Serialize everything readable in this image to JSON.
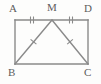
{
  "figure": {
    "kind": "geometry-diagram",
    "background_color": "#fdfdfc",
    "stroke_color": "#8a8a8a",
    "label_color": "#5d5d5d",
    "stroke_width": 1.4,
    "tick_stroke_width": 1.1,
    "labels": {
      "A": "A",
      "M": "M",
      "D": "D",
      "B": "B",
      "C": "C"
    },
    "points": {
      "A": {
        "x": 15,
        "y": 20
      },
      "M": {
        "x": 52,
        "y": 20
      },
      "D": {
        "x": 88,
        "y": 20
      },
      "B": {
        "x": 15,
        "y": 64
      },
      "C": {
        "x": 88,
        "y": 64
      }
    },
    "segments": [
      {
        "name": "AD",
        "from": "A",
        "to": "D",
        "ticks": 0
      },
      {
        "name": "AB",
        "from": "A",
        "to": "B",
        "ticks": 0
      },
      {
        "name": "DC",
        "from": "D",
        "to": "C",
        "ticks": 0
      },
      {
        "name": "BC",
        "from": "B",
        "to": "C",
        "ticks": 0
      },
      {
        "name": "AM",
        "from": "A",
        "to": "M",
        "ticks": 2
      },
      {
        "name": "MD",
        "from": "M",
        "to": "D",
        "ticks": 2
      },
      {
        "name": "MB",
        "from": "M",
        "to": "B",
        "ticks": 1
      },
      {
        "name": "MC",
        "from": "M",
        "to": "C",
        "ticks": 1
      }
    ],
    "tick_marks": [
      {
        "on": "AM",
        "count": 2,
        "cx": 32,
        "cy": 20,
        "orientation": "vertical"
      },
      {
        "on": "MD",
        "count": 2,
        "cx": 71,
        "cy": 20,
        "orientation": "vertical"
      },
      {
        "on": "MB",
        "count": 1,
        "cx": 33.5,
        "cy": 42
      },
      {
        "on": "MC",
        "count": 1,
        "cx": 70,
        "cy": 42
      }
    ]
  }
}
